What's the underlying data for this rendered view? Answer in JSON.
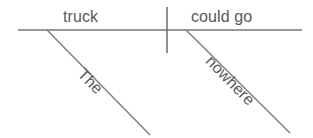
{
  "diagram": {
    "kind": "sentence-diagram",
    "style": "Reed-Kellogg",
    "sentence": "The truck could go nowhere",
    "canvas": {
      "width": 313,
      "height": 138,
      "background": "#ffffff"
    },
    "colors": {
      "line": "#757575",
      "text": "#595959",
      "background": "#ffffff"
    },
    "baseline": {
      "label": "baseline",
      "x1": 18,
      "y1": 30,
      "x2": 302,
      "y2": 30
    },
    "divider": {
      "label": "subject-predicate-divider",
      "x1": 167,
      "y1": 7,
      "x2": 167,
      "y2": 53
    },
    "words": {
      "subject": "truck",
      "predicate": "could go",
      "article": "The",
      "adverb": "nowhere"
    },
    "modifier_lines": [
      {
        "label": "article-slant",
        "x1": 47,
        "y1": 30,
        "x2": 150,
        "y2": 135
      },
      {
        "label": "adverb-slant",
        "x1": 186,
        "y1": 30,
        "x2": 290,
        "y2": 133
      }
    ]
  }
}
